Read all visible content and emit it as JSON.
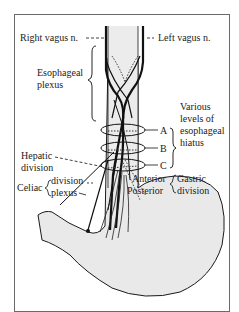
{
  "diagram": {
    "type": "anatomical-illustration",
    "labels": {
      "right_vagus": "Right vagus n.",
      "left_vagus": "Left vagus n.",
      "esophageal_plexus_1": "Esophageal",
      "esophageal_plexus_2": "plexus",
      "level_a": "A",
      "level_b": "B",
      "level_c": "C",
      "hiatus_1": "Various",
      "hiatus_2": "levels of",
      "hiatus_3": "esophageal",
      "hiatus_4": "hiatus",
      "hepatic_1": "Hepatic",
      "hepatic_2": "division",
      "celiac": "Celiac",
      "celiac_division": "division",
      "celiac_plexus": "plexus",
      "anterior": "Anterior",
      "posterior": "Posterior",
      "gastric": "Gastric",
      "gastric_division": "division"
    },
    "colors": {
      "line": "#1a1a1a",
      "fill": "#e9e9e9",
      "frame": "#6a6a6a"
    }
  }
}
